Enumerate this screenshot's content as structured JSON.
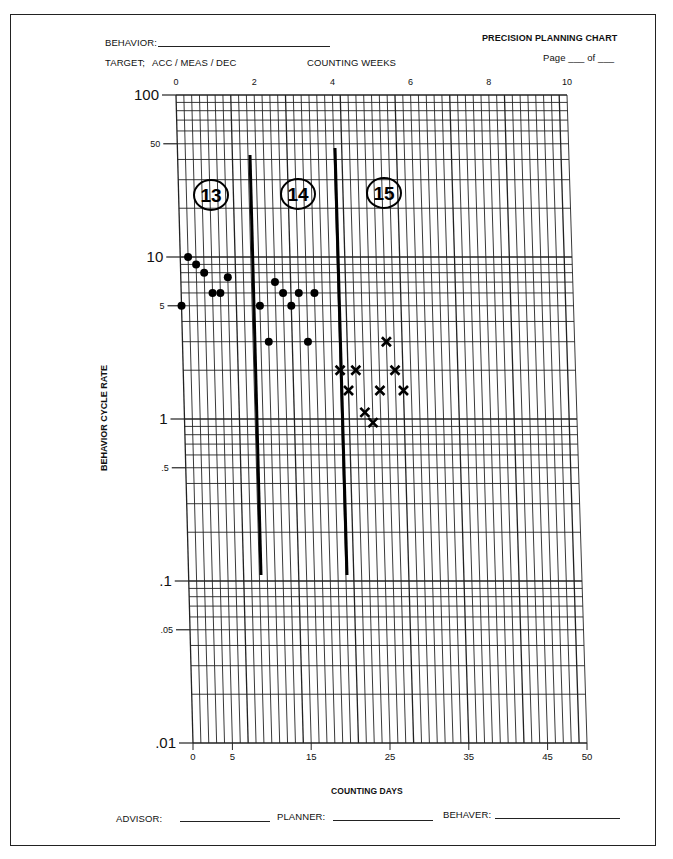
{
  "header": {
    "behavior_label": "BEHAVIOR:",
    "title": "PRECISION PLANNING CHART",
    "target_label": "TARGET;",
    "target_options": "ACC  /  MEAS  /  DEC",
    "weeks_axis_title": "COUNTING WEEKS",
    "page_label": "Page ___ of ___"
  },
  "footer": {
    "days_axis_title": "COUNTING DAYS",
    "advisor_label": "ADVISOR:",
    "planner_label": "PLANNER:",
    "behaver_label": "BEHAVER:"
  },
  "y_axis_title": "BEHAVIOR CYCLE RATE",
  "chart_data": {
    "type": "scatter",
    "title": "PRECISION PLANNING CHART",
    "xlabel": "COUNTING DAYS",
    "x2label": "COUNTING WEEKS",
    "ylabel": "BEHAVIOR CYCLE RATE",
    "yscale": "log",
    "ylim": [
      0.01,
      100
    ],
    "xlim": [
      0,
      50
    ],
    "y_ticks": [
      {
        "value": 100,
        "label": "100"
      },
      {
        "value": 50,
        "label": "50"
      },
      {
        "value": 10,
        "label": "10"
      },
      {
        "value": 5,
        "label": "5"
      },
      {
        "value": 1,
        "label": "1"
      },
      {
        "value": 0.5,
        "label": ".5"
      },
      {
        "value": 0.1,
        "label": ".1"
      },
      {
        "value": 0.05,
        "label": ".05"
      },
      {
        "value": 0.01,
        "label": ".01"
      }
    ],
    "x_ticks_days": [
      "0",
      "5",
      "15",
      "25",
      "35",
      "45",
      "50"
    ],
    "x_ticks_weeks": [
      "0",
      "2",
      "4",
      "6",
      "8",
      "10"
    ],
    "grid": true,
    "phase_labels": [
      "13",
      "14",
      "15"
    ],
    "phase_change_lines_day": [
      8.5,
      19.5
    ],
    "series": [
      {
        "name": "Phase 13",
        "marker": "dot",
        "points": [
          {
            "day": 0,
            "rate": 5
          },
          {
            "day": 1,
            "rate": 10
          },
          {
            "day": 2,
            "rate": 9
          },
          {
            "day": 3,
            "rate": 8
          },
          {
            "day": 4,
            "rate": 6
          },
          {
            "day": 5,
            "rate": 6
          },
          {
            "day": 6,
            "rate": 7.5
          }
        ]
      },
      {
        "name": "Phase 14",
        "marker": "dot",
        "points": [
          {
            "day": 10,
            "rate": 5
          },
          {
            "day": 11,
            "rate": 3
          },
          {
            "day": 12,
            "rate": 7
          },
          {
            "day": 13,
            "rate": 6
          },
          {
            "day": 14,
            "rate": 5
          },
          {
            "day": 15,
            "rate": 6
          },
          {
            "day": 16,
            "rate": 3
          },
          {
            "day": 17,
            "rate": 6
          }
        ]
      },
      {
        "name": "Phase 15",
        "marker": "x",
        "points": [
          {
            "day": 20,
            "rate": 2
          },
          {
            "day": 21,
            "rate": 1.5
          },
          {
            "day": 22,
            "rate": 2
          },
          {
            "day": 23,
            "rate": 1.1
          },
          {
            "day": 24,
            "rate": 0.95
          },
          {
            "day": 25,
            "rate": 1.5
          },
          {
            "day": 26,
            "rate": 3
          },
          {
            "day": 27,
            "rate": 2
          },
          {
            "day": 28,
            "rate": 1.5
          }
        ]
      }
    ]
  }
}
